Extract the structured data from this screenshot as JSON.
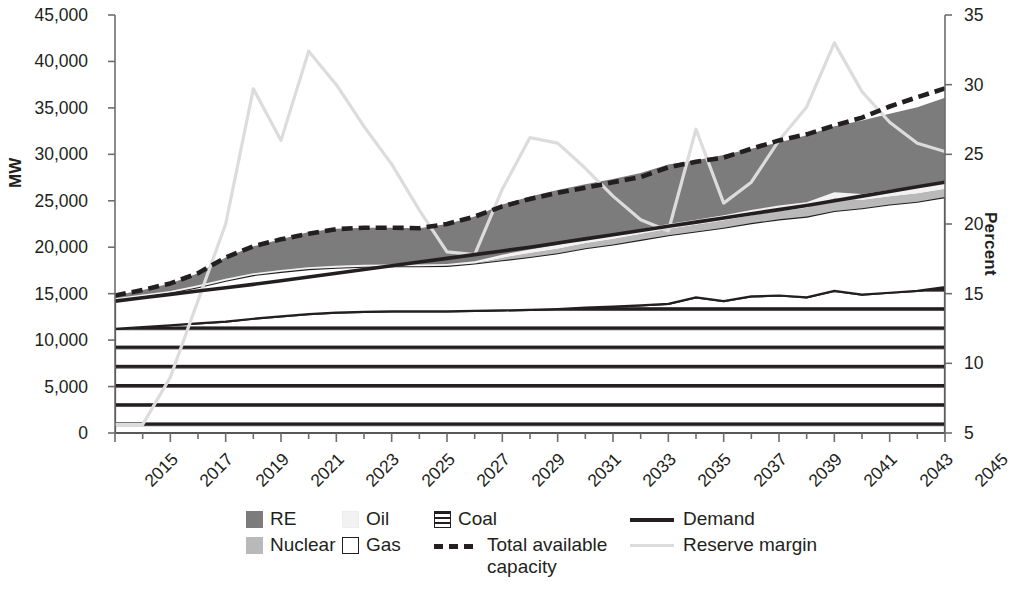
{
  "axes": {
    "ylabel_left": "MW",
    "ylabel_right": "Percent",
    "left_ticks": [
      "0",
      "5,000",
      "10,000",
      "15,000",
      "20,000",
      "25,000",
      "30,000",
      "35,000",
      "40,000",
      "45,000"
    ],
    "right_ticks": [
      "5",
      "10",
      "15",
      "20",
      "25",
      "30",
      "35"
    ],
    "x_ticks": [
      "2015",
      "2017",
      "2019",
      "2021",
      "2023",
      "2025",
      "2027",
      "2029",
      "2031",
      "2033",
      "2035",
      "2037",
      "2039",
      "2041",
      "2043",
      "2045"
    ]
  },
  "legend": {
    "re": "RE",
    "oil": "Oil",
    "coal": "Coal",
    "nuclear": "Nuclear",
    "gas": "Gas",
    "total": "Total available capacity",
    "demand": "Demand",
    "reserve": "Reserve margin"
  },
  "colors": {
    "re": "#7c7c7c",
    "oil": "#f2f2f2",
    "nuclear": "#b9b9b9",
    "gas": "#ffffff",
    "coal_line": "#231f20",
    "demand": "#231f20",
    "total": "#231f20",
    "reserve": "#dcdcdc",
    "axis": "#6d6d6d"
  },
  "chart_data": {
    "type": "area",
    "title": "",
    "xlabel": "",
    "ylabel": "MW",
    "ylabel_secondary": "Percent",
    "ylim": [
      0,
      45000
    ],
    "ylim_secondary": [
      5,
      35
    ],
    "xlim": [
      2015,
      2045
    ],
    "grid": false,
    "legend_position": "bottom",
    "x": [
      2015,
      2016,
      2017,
      2018,
      2019,
      2020,
      2021,
      2022,
      2023,
      2024,
      2025,
      2026,
      2027,
      2028,
      2029,
      2030,
      2031,
      2032,
      2033,
      2034,
      2035,
      2036,
      2037,
      2038,
      2039,
      2040,
      2041,
      2042,
      2043,
      2044,
      2045
    ],
    "series": [
      {
        "name": "Coal",
        "type": "stacked-area",
        "fill": "horizontal-hatch",
        "values": [
          11200,
          11400,
          11600,
          11800,
          12000,
          12300,
          12550,
          12800,
          12950,
          13050,
          13100,
          13100,
          13100,
          13150,
          13200,
          13250,
          13350,
          13500,
          13600,
          13750,
          13900,
          14600,
          14200,
          14700,
          14800,
          14600,
          15300,
          14900,
          15100,
          15300,
          15700
        ]
      },
      {
        "name": "Gas",
        "type": "stacked-area",
        "fill": "white",
        "values": [
          3100,
          3300,
          3500,
          3900,
          4400,
          4700,
          4800,
          4850,
          4850,
          4850,
          4850,
          4850,
          4900,
          5100,
          5400,
          5700,
          6000,
          6400,
          6700,
          7050,
          7400,
          7100,
          7900,
          7900,
          8200,
          8700,
          8600,
          9300,
          9500,
          9600,
          9700
        ]
      },
      {
        "name": "Nuclear",
        "type": "stacked-area",
        "fill": "light-gray",
        "values": [
          0,
          0,
          0,
          0,
          0,
          0,
          0,
          0,
          0,
          0,
          0,
          0,
          0,
          0,
          300,
          450,
          500,
          550,
          600,
          650,
          700,
          750,
          800,
          850,
          900,
          950,
          1400,
          900,
          900,
          900,
          900
        ]
      },
      {
        "name": "Oil",
        "type": "stacked-area",
        "fill": "very-light",
        "values": [
          200,
          200,
          200,
          200,
          200,
          200,
          200,
          200,
          200,
          200,
          200,
          200,
          200,
          250,
          300,
          350,
          400,
          420,
          450,
          480,
          500,
          520,
          540,
          560,
          580,
          600,
          620,
          640,
          660,
          680,
          700
        ]
      },
      {
        "name": "RE",
        "type": "stacked-area",
        "fill": "dark-gray",
        "values": [
          300,
          500,
          800,
          1300,
          2300,
          2900,
          3300,
          3800,
          4000,
          4000,
          3950,
          3900,
          4300,
          4800,
          5400,
          5700,
          5900,
          5900,
          6000,
          6050,
          6400,
          6400,
          6500,
          6600,
          6800,
          7200,
          7100,
          7900,
          8200,
          8600,
          9100
        ]
      }
    ],
    "lines": [
      {
        "name": "Total available capacity",
        "style": "dashed",
        "axis": "left",
        "values": [
          14800,
          15400,
          16100,
          17200,
          18900,
          20100,
          20850,
          21450,
          21950,
          22100,
          22100,
          22050,
          22500,
          23300,
          24400,
          25200,
          25850,
          26400,
          27000,
          27550,
          28600,
          29200,
          29650,
          30600,
          31500,
          32150,
          33100,
          33950,
          35150,
          36150,
          37100
        ]
      },
      {
        "name": "Demand",
        "style": "solid",
        "axis": "left",
        "values": [
          14200,
          14560,
          14920,
          15280,
          15640,
          16000,
          16400,
          16800,
          17200,
          17600,
          18000,
          18400,
          18800,
          19200,
          19600,
          20000,
          20450,
          20900,
          21350,
          21800,
          22250,
          22700,
          23150,
          23600,
          24050,
          24500,
          25000,
          25500,
          26000,
          26500,
          27000
        ]
      },
      {
        "name": "Reserve margin",
        "style": "solid-light",
        "axis": "right",
        "values": [
          5.6,
          5.6,
          9.0,
          14.5,
          20.0,
          29.7,
          26.0,
          32.4,
          30.0,
          27.0,
          24.3,
          21.0,
          18.0,
          17.8,
          22.5,
          26.2,
          25.8,
          24.0,
          22.0,
          20.3,
          19.5,
          26.8,
          21.5,
          23.0,
          26.0,
          28.4,
          33.0,
          29.5,
          27.3,
          25.8,
          25.2
        ]
      }
    ]
  }
}
